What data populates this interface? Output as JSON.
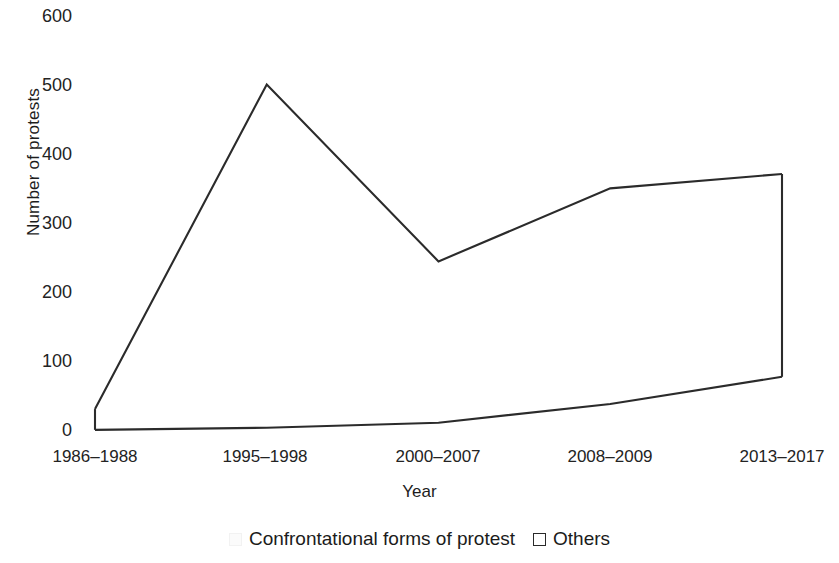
{
  "chart_data": {
    "type": "line",
    "title": "",
    "xlabel": "Year",
    "ylabel": "Number of protests",
    "categories": [
      "1986–1988",
      "1995–1998",
      "2000–2007",
      "2008–2009",
      "2013–2017"
    ],
    "series": [
      {
        "name": "Confrontational forms of protest",
        "values": [
          32,
          485,
          238,
          340,
          360
        ]
      },
      {
        "name": "Others",
        "values": [
          3,
          6,
          13,
          39,
          77
        ]
      }
    ],
    "ylim": [
      0,
      600
    ],
    "yticks": [
      0,
      100,
      200,
      300,
      400,
      500,
      600
    ],
    "ytick_labels": [
      "0",
      "100",
      "200",
      "300",
      "400",
      "500",
      "600"
    ],
    "grid": false,
    "legend_position": "bottom",
    "legend": [
      {
        "label": "Confrontational forms of protest",
        "swatch": "faint-square-marker"
      },
      {
        "label": "Others",
        "swatch": "open-square-marker"
      }
    ]
  },
  "axis": {
    "y_title": "Number of protests",
    "x_title": "Year"
  }
}
